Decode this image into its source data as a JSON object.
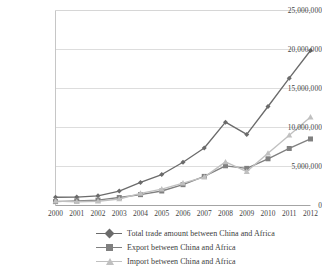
{
  "chart_data": {
    "type": "line",
    "title": "",
    "xlabel": "",
    "ylabel": "",
    "x": [
      2000,
      2001,
      2002,
      2003,
      2004,
      2005,
      2006,
      2007,
      2008,
      2009,
      2010,
      2011,
      2012
    ],
    "categories": [
      "2000",
      "2001",
      "2002",
      "2003",
      "2004",
      "2005",
      "2006",
      "2007",
      "2008",
      "2009",
      "2010",
      "2011",
      "2012"
    ],
    "ylim": [
      0,
      25000000
    ],
    "yticks": [
      0,
      5000000,
      10000000,
      15000000,
      20000000,
      25000000
    ],
    "ytick_labels": [
      "0",
      "5,000,000",
      "10,000,000",
      "15,000,000",
      "20,000,000",
      "25,000,000"
    ],
    "grid": true,
    "legend_position": "bottom",
    "series": [
      {
        "name": "Total trade amount between China and Africa",
        "marker": "diamond",
        "color": "#6b6b6b",
        "values": [
          1060000,
          1080000,
          1240000,
          1850000,
          2950000,
          3970000,
          5550000,
          7370000,
          10680000,
          9110000,
          12690000,
          16320000,
          19870000
        ]
      },
      {
        "name": "Export between China and Africa",
        "marker": "square",
        "color": "#808080",
        "values": [
          500000,
          600000,
          690000,
          1020000,
          1390000,
          1860000,
          2670000,
          3730000,
          5090000,
          4760000,
          5990000,
          7310000,
          8530000
        ]
      },
      {
        "name": "Import between China and Africa",
        "marker": "triangle",
        "color": "#c0c0c0",
        "values": [
          560000,
          480000,
          550000,
          830000,
          1560000,
          2110000,
          2880000,
          3640000,
          5590000,
          4350000,
          6700000,
          9010000,
          11340000
        ]
      }
    ]
  },
  "axes": {
    "ytick_labels": [
      "25,000,000",
      "20,000,000",
      "15,000,000",
      "10,000,000",
      "5,000,000",
      "0"
    ],
    "xtick_labels": [
      "2000",
      "2001",
      "2002",
      "2003",
      "2004",
      "2005",
      "2006",
      "2007",
      "2008",
      "2009",
      "2010",
      "2011",
      "2012"
    ]
  },
  "legend": {
    "items": [
      {
        "label": "Total trade amount between China and Africa",
        "marker": "diamond",
        "color": "#6b6b6b"
      },
      {
        "label": "Export between China and Africa",
        "marker": "square",
        "color": "#808080"
      },
      {
        "label": "Import between China and Africa",
        "marker": "triangle",
        "color": "#c0c0c0"
      }
    ]
  },
  "colors": {
    "total": "#6b6b6b",
    "export": "#808080",
    "import": "#c0c0c0",
    "grid": "#d4d4d4",
    "frame": "#bfbfbf",
    "text": "#3c3c3c"
  }
}
